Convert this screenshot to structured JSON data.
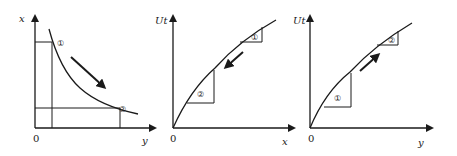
{
  "panels": [
    {
      "id": "indifference-curve",
      "y_axis_label": "x",
      "x_axis_label": "y",
      "origin_label": "0",
      "points": [
        {
          "label": "①",
          "description": "start point on curve"
        },
        {
          "label": "②",
          "description": "end point on curve"
        }
      ],
      "arrow_direction": "down-right"
    },
    {
      "id": "utility-of-x",
      "y_axis_label": "Ut",
      "x_axis_label": "x",
      "origin_label": "0",
      "points": [
        {
          "label": "①",
          "description": "upper slope triangle"
        },
        {
          "label": "②",
          "description": "lower slope triangle"
        }
      ],
      "arrow_direction": "down-left"
    },
    {
      "id": "utility-of-y",
      "y_axis_label": "Ut",
      "x_axis_label": "y",
      "origin_label": "0",
      "points": [
        {
          "label": "①",
          "description": "lower slope triangle"
        },
        {
          "label": "②",
          "description": "upper slope triangle"
        }
      ],
      "arrow_direction": "up-right"
    }
  ]
}
